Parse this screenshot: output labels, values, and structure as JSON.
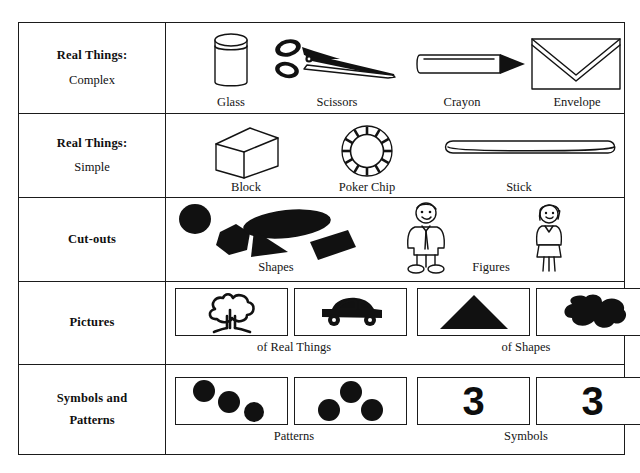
{
  "figure": {
    "border_color": "#1b1b1b",
    "ink_color": "#111111",
    "background": "#ffffff"
  },
  "rows": [
    {
      "label_line1": "Real Things:",
      "label_line2": "Complex",
      "label_bold_second": false,
      "items": [
        {
          "caption": "Glass",
          "icon": "cylinder-glass-icon"
        },
        {
          "caption": "Scissors",
          "icon": "scissors-icon"
        },
        {
          "caption": "Crayon",
          "icon": "crayon-icon"
        },
        {
          "caption": "Envelope",
          "icon": "envelope-icon"
        }
      ]
    },
    {
      "label_line1": "Real Things:",
      "label_line2": "Simple",
      "label_bold_second": false,
      "items": [
        {
          "caption": "Block",
          "icon": "cube-block-icon"
        },
        {
          "caption": "Poker Chip",
          "icon": "poker-chip-icon"
        },
        {
          "caption": "Stick",
          "icon": "stick-icon"
        }
      ]
    },
    {
      "label_line1": "Cut-outs",
      "label_line2": "",
      "label_bold_second": false,
      "items": [
        {
          "caption": "Shapes",
          "icon": "cutout-shapes-icon"
        },
        {
          "caption": "Figures",
          "icon": "cutout-figures-icon"
        }
      ]
    },
    {
      "label_line1": "Pictures",
      "label_line2": "",
      "label_bold_second": false,
      "items": [
        {
          "caption": "of Real Things",
          "icon": "picture-tree-icon"
        },
        {
          "caption": "of Shapes",
          "icon": "picture-triangle-icon"
        }
      ]
    },
    {
      "label_line1": "Symbols and",
      "label_line2": "Patterns",
      "label_bold_second": true,
      "items": [
        {
          "caption": "Patterns",
          "icon": "pattern-dots-icon"
        },
        {
          "caption": "Symbols",
          "icon": "numeral-three-icon"
        }
      ]
    }
  ],
  "captions": {
    "glass": "Glass",
    "scissors": "Scissors",
    "crayon": "Crayon",
    "envelope": "Envelope",
    "block": "Block",
    "poker_chip": "Poker Chip",
    "stick": "Stick",
    "shapes": "Shapes",
    "figures": "Figures",
    "of_real_things": "of Real Things",
    "of_shapes": "of Shapes",
    "patterns": "Patterns",
    "symbols": "Symbols"
  },
  "symbols": {
    "numeral_left": "3",
    "numeral_right": "3"
  },
  "labels": {
    "real_things": "Real Things:",
    "complex": "Complex",
    "simple": "Simple",
    "cutouts": "Cut-outs",
    "pictures": "Pictures",
    "symbols_and": "Symbols and",
    "patterns": "Patterns"
  }
}
